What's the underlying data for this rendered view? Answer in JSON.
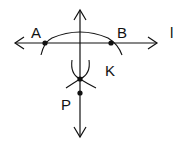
{
  "diagram": {
    "colors": {
      "stroke": "#111111",
      "background": "#ffffff"
    },
    "labels": {
      "A": "A",
      "B": "B",
      "l": "l",
      "K": "K",
      "P": "P"
    },
    "points": [
      {
        "name": "A",
        "x": 45,
        "y": 43
      },
      {
        "name": "B",
        "x": 111,
        "y": 43
      },
      {
        "name": "K",
        "x": 80,
        "y": 79
      },
      {
        "name": "P",
        "x": 80,
        "y": 93
      }
    ],
    "lines": [
      {
        "name": "l",
        "type": "horizontal-double-arrow",
        "from": [
          15,
          43
        ],
        "to": [
          157,
          43
        ]
      },
      {
        "name": "perpendicular",
        "type": "vertical-double-arrow",
        "from": [
          80,
          10
        ],
        "to": [
          80,
          137
        ]
      }
    ],
    "arcs": [
      {
        "name": "arc-through-A-B",
        "center": "P"
      },
      {
        "name": "arc-from-A",
        "center": "A"
      },
      {
        "name": "arc-from-B",
        "center": "B"
      }
    ]
  }
}
